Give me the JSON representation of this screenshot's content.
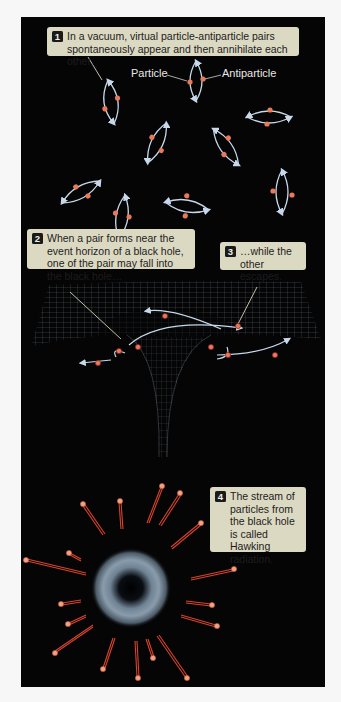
{
  "figure": {
    "background": "#050505",
    "caption_bg": "#dcd9c3",
    "particle_color": "#e8795a",
    "orbit_color": "#c6d8ea",
    "ray_color": "#d8432e"
  },
  "captions": [
    {
      "number": "1",
      "text": "In a vacuum, virtual particle-antiparticle pairs spontaneously appear and then annihilate each other."
    },
    {
      "number": "2",
      "text": "When a pair forms near the event horizon of a black hole, one of the pair may fall into the black hole…"
    },
    {
      "number": "3",
      "text": "…while the other escapes."
    },
    {
      "number": "4",
      "text": "The stream of particles from the black hole is called Hawking radiation."
    }
  ],
  "labels": {
    "particle": "Particle",
    "antiparticle": "Antiparticle"
  },
  "sections": [
    {
      "name": "virtual-pairs",
      "description": "Virtual particle-antiparticle pairs in vacuum",
      "pair_count": 10
    },
    {
      "name": "event-horizon",
      "description": "Pairs forming near a black hole's curved spacetime grid"
    },
    {
      "name": "hawking-radiation",
      "description": "Particles radiating outward from a black hole"
    }
  ]
}
